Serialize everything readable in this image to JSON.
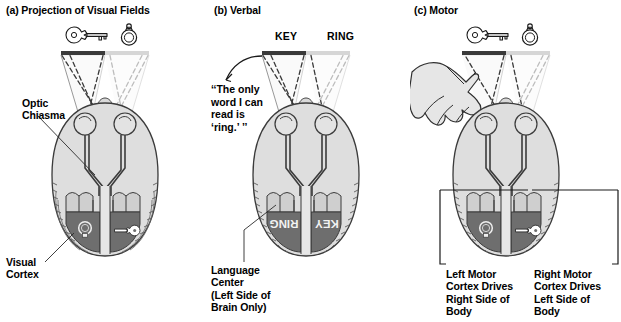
{
  "figure": {
    "panels": [
      {
        "id": "a",
        "title": "(a) Projection of Visual Fields",
        "stimuli": [
          "key-icon",
          "ring-icon"
        ],
        "labels": [
          {
            "name": "optic-chiasma-label",
            "text": "Optic\nChiasma"
          },
          {
            "name": "visual-cortex-label",
            "text": "Visual\nCortex"
          }
        ],
        "cortex_contents": {
          "left": "ring-icon",
          "right": "key-icon"
        }
      },
      {
        "id": "b",
        "title": "(b) Verbal",
        "stim_words": [
          "KEY",
          "RING"
        ],
        "quote": "‘‘The only\nword I can\nread is\n‘ring.’ ’’",
        "labels": [
          {
            "name": "language-center-label",
            "text": "Language\nCenter\n(Left Side of\nBrain Only)"
          }
        ],
        "cortex_contents": {
          "left": "RING",
          "right": "KEY"
        }
      },
      {
        "id": "c",
        "title": "(c) Motor",
        "stimuli": [
          "key-icon",
          "ring-icon"
        ],
        "labels": [
          {
            "name": "left-motor-cortex-label",
            "text": "Left Motor\nCortex Drives\nRight Side of\nBody"
          },
          {
            "name": "right-motor-cortex-label",
            "text": "Right Motor\nCortex Drives\nLeft Side of\nBody"
          }
        ],
        "cortex_contents": {
          "left": "ring-icon",
          "right": "key-icon"
        }
      }
    ],
    "colors": {
      "background": "#ffffff",
      "ink": "#000000",
      "brain_fill": "#d9d9d9",
      "brain_light": "#e8e8e8",
      "cortex_dark": "#6e6e6e",
      "cortex_band": "#c4c4c4",
      "screen_dark": "#3a3a3a",
      "screen_light": "#d0d0d0",
      "hand_fill": "#e2e2e2"
    }
  }
}
